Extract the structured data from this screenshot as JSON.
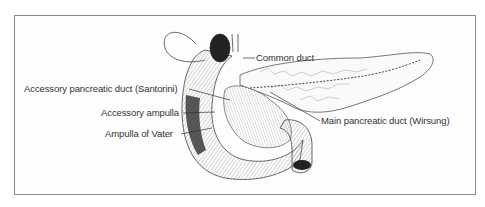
{
  "figure": {
    "labels": {
      "common_duct": "Common duct",
      "accessory_duct": "Accessory pancreatic duct (Santorini)",
      "accessory_ampulla": "Accessory ampulla",
      "ampulla_vater": "Ampulla of Vater",
      "main_duct": "Main pancreatic duct (Wirsung)"
    }
  }
}
